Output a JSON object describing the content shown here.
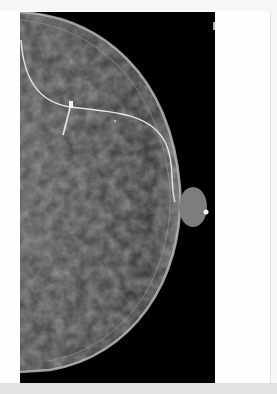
{
  "image": {
    "type": "mammogram",
    "view": "craniocaudal",
    "colors": {
      "background": "#000000",
      "tissue": "#8a8a8a",
      "frame": "#fefefe",
      "annotation_line": "#e8e8e8"
    },
    "annotations": [
      {
        "kind": "curved-line",
        "description": "wire/contour line across breast"
      },
      {
        "kind": "marker-clip",
        "description": "bright clip marker near upper-middle"
      },
      {
        "kind": "nipple-marker",
        "description": "bright dot at nipple"
      }
    ]
  }
}
